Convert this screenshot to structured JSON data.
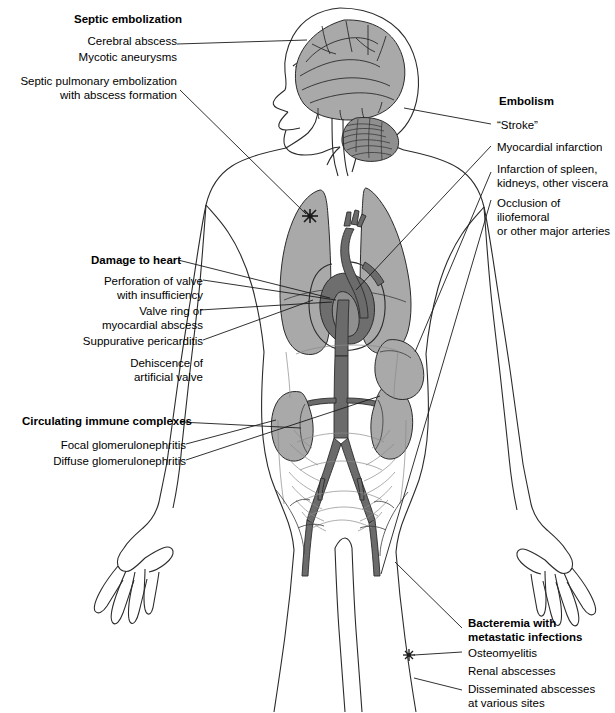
{
  "diagram": {
    "title_visible": false,
    "colors": {
      "background": "#ffffff",
      "outline": "#2b2b2b",
      "organ_light_gray": "#a9a9a9",
      "organ_mid_gray": "#8f8f8f",
      "organ_dark_gray": "#6e6e6e",
      "vessel_gray": "#6b6b6b",
      "text": "#000000"
    },
    "figure": {
      "name": "anterior human body with left-facing head profile",
      "organs": [
        "brain",
        "cerebellum",
        "brainstem",
        "left lung",
        "right lung",
        "heart",
        "aortic arch",
        "aorta",
        "iliac arteries",
        "femoral arteries",
        "left kidney",
        "right kidney",
        "spleen",
        "intestines"
      ],
      "markers": [
        {
          "name": "pulmonary-abscess-starburst",
          "x": 310,
          "y": 216
        },
        {
          "name": "osteomyelitis-starburst",
          "x": 409,
          "y": 655
        }
      ]
    },
    "groups": [
      {
        "id": "septic-embolization",
        "heading": "Septic embolization",
        "side": "left",
        "items": [
          "Cerebral abscess",
          "Mycotic aneurysms",
          "Septic pulmonary embolization\nwith abscess formation"
        ]
      },
      {
        "id": "embolism",
        "heading": "Embolism",
        "side": "right",
        "items": [
          "“Stroke”",
          "Myocardial infarction",
          "Infarction of spleen,\nkidneys, other viscera",
          "Occlusion of iliofemoral\nor other major arteries"
        ]
      },
      {
        "id": "damage-to-heart",
        "heading": "Damage to heart",
        "side": "left",
        "items": [
          "Perforation of valve\nwith insufficiency",
          "Valve ring or\nmyocardial abscess",
          "Suppurative pericarditis",
          "Dehiscence of\nartificial valve"
        ]
      },
      {
        "id": "circulating-immune-complexes",
        "heading": "Circulating immune complexes",
        "side": "left",
        "items": [
          "Focal glomerulonephritis",
          "Diffuse glomerulonephritis"
        ]
      },
      {
        "id": "bacteremia",
        "heading": "Bacteremia with\nmetastatic infections",
        "side": "right",
        "items": [
          "Osteomyelitis",
          "Renal abscesses",
          "Disseminated abscesses\n at various sites"
        ]
      }
    ]
  }
}
